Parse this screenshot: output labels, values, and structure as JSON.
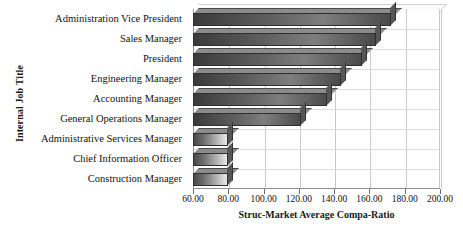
{
  "chart_data": {
    "type": "bar",
    "orientation": "horizontal",
    "title": "",
    "xlabel": "Struc-Market Average Compa-Ratio",
    "ylabel": "Internal Job Title",
    "xlim": [
      60.0,
      200.0
    ],
    "xticks": [
      "60.00",
      "80.00",
      "100.00",
      "120.00",
      "140.00",
      "160.00",
      "180.00",
      "200.00"
    ],
    "xtick_values": [
      60,
      80,
      100,
      120,
      140,
      160,
      180,
      200
    ],
    "grid": true,
    "legend": "none",
    "categories": [
      "Administration Vice President",
      "Sales Manager",
      "President",
      "Engineering Manager",
      "Accounting Manager",
      "General Operations Manager",
      "Administrative Services Manager",
      "Chief Information Officer",
      "Construction Manager"
    ],
    "values": [
      172.0,
      164.0,
      156.0,
      144.0,
      136.0,
      121.0,
      80.0,
      80.0,
      80.0
    ],
    "bar_style": [
      "dark",
      "dark",
      "dark",
      "dark",
      "dark",
      "dark",
      "light",
      "light",
      "light"
    ]
  },
  "colors": {
    "bar_dark_start": "#3a3a3a",
    "bar_dark_end": "#4a4a4a",
    "bar_light_end": "#e8e8e8",
    "grid": "#c9c9c9",
    "axis": "#8f8f8f",
    "text": "#111111",
    "background": "#ffffff"
  }
}
